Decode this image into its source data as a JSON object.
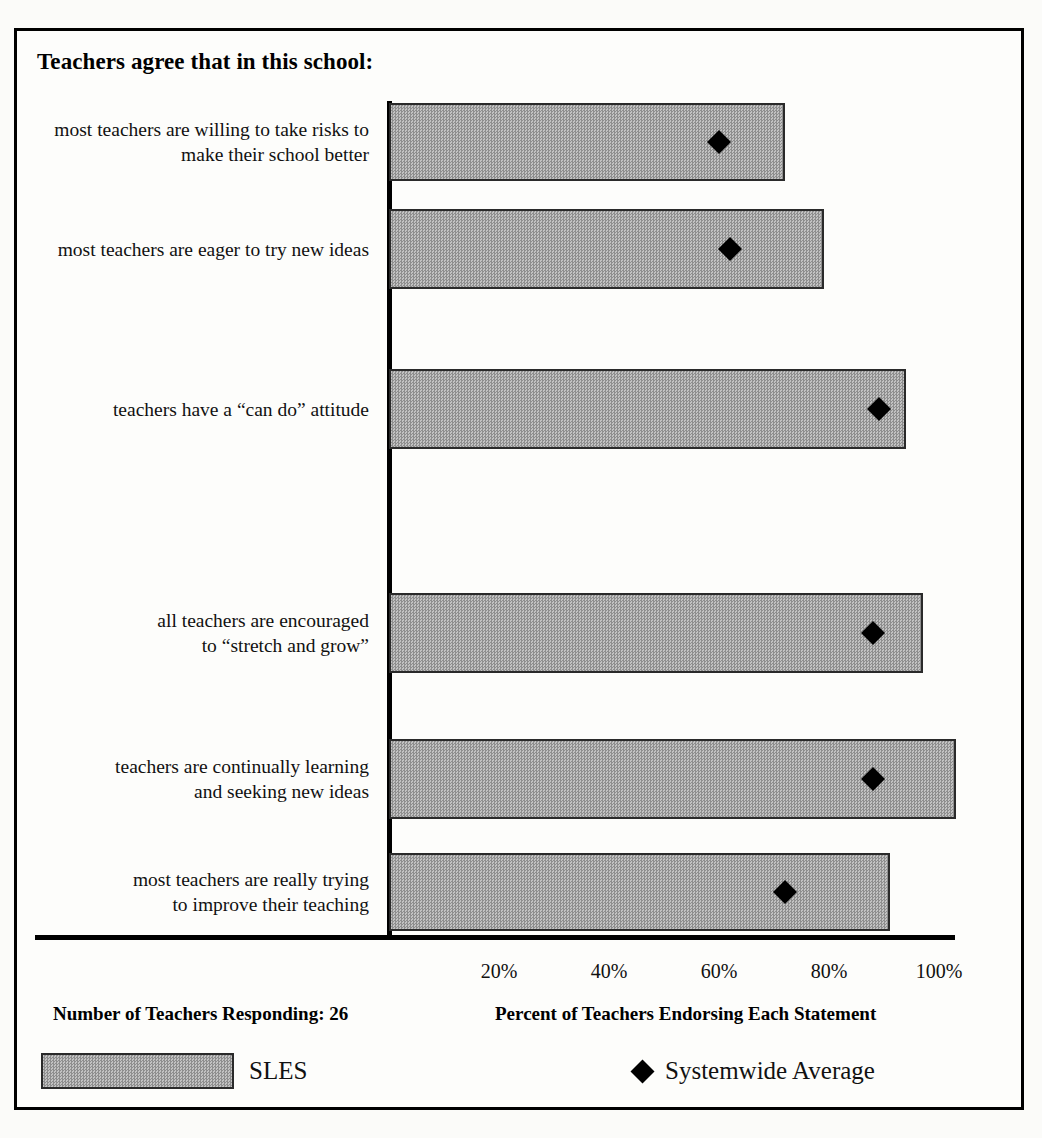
{
  "chart_data": {
    "type": "bar",
    "title": "Teachers agree that in this school:",
    "xlabel": "Percent of Teachers Endorsing Each Statement",
    "ylabel": "",
    "orientation": "horizontal",
    "xlim": [
      0,
      110
    ],
    "grid": false,
    "tick_labels": [
      "20%",
      "40%",
      "60%",
      "80%",
      "100%"
    ],
    "tick_values": [
      20,
      40,
      60,
      80,
      100
    ],
    "categories": [
      "most teachers are willing to take risks to make their school better",
      "most teachers are eager to try new ideas",
      "teachers have a “can do” attitude",
      "",
      "all teachers are encouraged to “stretch and grow”",
      "teachers are continually learning and seeking new ideas",
      "most teachers are really trying to improve their teaching"
    ],
    "series": [
      {
        "name": "SLES",
        "type": "bar",
        "values": [
          72,
          79,
          94,
          null,
          97,
          103,
          91
        ]
      },
      {
        "name": "Systemwide Average",
        "type": "marker",
        "marker": "diamond",
        "values": [
          60,
          62,
          89,
          null,
          88,
          88,
          72
        ]
      }
    ],
    "annotations": {
      "sample_size_note": "Number of Teachers Responding: 26"
    }
  },
  "header": {
    "title": "Teachers agree that in this school:"
  },
  "rows": [
    {
      "label_line1": "most teachers are willing to take risks to",
      "label_line2": "make their school better",
      "bar": 72,
      "marker": 60
    },
    {
      "label_line1": "most teachers are eager to try new ideas",
      "label_line2": "",
      "bar": 79,
      "marker": 62
    },
    {
      "label_line1": "teachers have a “can do” attitude",
      "label_line2": "",
      "bar": 94,
      "marker": 89
    },
    {
      "label_line1": "all teachers are encouraged",
      "label_line2": "to “stretch and grow”",
      "bar": 97,
      "marker": 88
    },
    {
      "label_line1": "teachers are continually learning",
      "label_line2": "and seeking new ideas",
      "bar": 103,
      "marker": 88
    },
    {
      "label_line1": "most teachers are really trying",
      "label_line2": "to improve their teaching",
      "bar": 91,
      "marker": 72
    }
  ],
  "axis": {
    "ticks": [
      {
        "label": "20%",
        "value": 20
      },
      {
        "label": "40%",
        "value": 40
      },
      {
        "label": "60%",
        "value": 60
      },
      {
        "label": "80%",
        "value": 80
      },
      {
        "label": "100%",
        "value": 100
      }
    ]
  },
  "footer": {
    "left_caption": "Number of Teachers Responding: 26",
    "right_caption": "Percent of Teachers Endorsing Each Statement"
  },
  "legend": {
    "bar_label": "SLES",
    "marker_label": "Systemwide Average",
    "marker_glyph": "◆"
  },
  "colors": {
    "bar_fill": "#a8a8a8",
    "bar_stroke": "#2a2a2a",
    "marker": "#000000",
    "axis": "#000000",
    "frame": "#000000",
    "background": "#fdfdfb",
    "text": "#111111"
  }
}
